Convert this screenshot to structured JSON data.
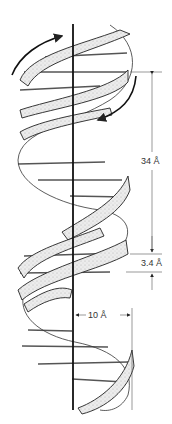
{
  "diagram": {
    "labels": {
      "pitch": "34 Å",
      "rise": "3.4 Å",
      "radius": "10 Å"
    },
    "colors": {
      "line": "#1a1a1a",
      "ribbon_fill": "#e6e6e6",
      "dimension": "#555555"
    }
  }
}
